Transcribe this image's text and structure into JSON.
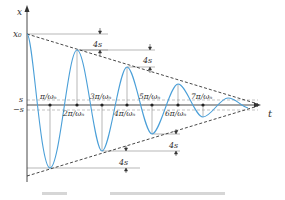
{
  "diagram": {
    "type": "damped-oscillation-coulomb-friction",
    "axes": {
      "x_label": "x",
      "t_label": "t",
      "x0_label": "x₀",
      "s_label": "s",
      "neg_s_label": "−s"
    },
    "envelope_step_label": "4s",
    "half_period_labels": [
      "π/ωₙ",
      "2π/ωₙ",
      "3π/ωₙ",
      "4π/ωₙ",
      "5π/ωₙ",
      "6π/ωₙ",
      "7π/ωₙ"
    ],
    "colors": {
      "curve": "#4a9fd8",
      "axis": "#333333",
      "envelope": "#333333",
      "guide": "#9a9a9a"
    }
  }
}
